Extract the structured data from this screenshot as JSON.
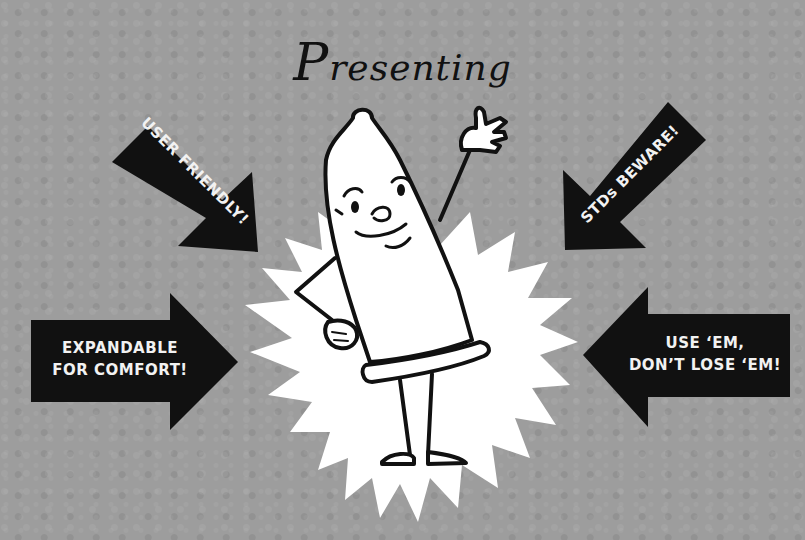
{
  "poster": {
    "title_initial": "P",
    "title_rest": "resenting",
    "mascot": "condom-mascot-waving",
    "colors": {
      "background": "#9d9d9d",
      "arrow_fill": "#111111",
      "arrow_text": "#f2f2f2",
      "starburst": "#ffffff",
      "outline": "#111111"
    },
    "arrows": [
      {
        "id": "top-left",
        "direction": "down-right",
        "label": "USER FRIENDLY!"
      },
      {
        "id": "top-right",
        "direction": "down-left",
        "label": "STDs BEWARE!"
      },
      {
        "id": "bottom-left",
        "direction": "right",
        "line1": "EXPANDABLE",
        "line2": "FOR COMFORT!"
      },
      {
        "id": "bottom-right",
        "direction": "left",
        "line1": "USE ‘EM,",
        "line2": "DON’T LOSE ‘EM!"
      }
    ]
  }
}
